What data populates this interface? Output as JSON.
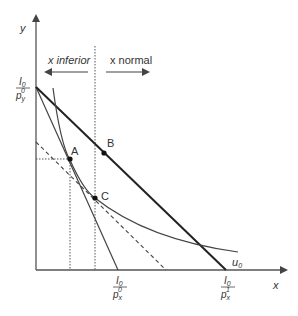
{
  "diagram": {
    "axes": {
      "y_label": "y",
      "x_label": "x"
    },
    "regions": {
      "left": "x inferior",
      "right": "x normal"
    },
    "intercepts": {
      "y_intercept": {
        "num": "I",
        "num_sub": "0",
        "den": "p",
        "den_sub": "y",
        "den_sup": "0"
      },
      "x_intercept_0": {
        "num": "I",
        "num_sub": "0",
        "den": "p",
        "den_sub": "x",
        "den_sup": "0"
      },
      "x_intercept_1": {
        "num": "I",
        "num_sub": "0",
        "den": "p",
        "den_sub": "x",
        "den_sup": "1"
      }
    },
    "points": {
      "A": "A",
      "B": "B",
      "C": "C"
    },
    "curve": {
      "label": "u",
      "sub": "0"
    },
    "colors": {
      "axis": "#555555",
      "line": "#333333",
      "thick_line": "#222222",
      "text": "#333333"
    }
  }
}
